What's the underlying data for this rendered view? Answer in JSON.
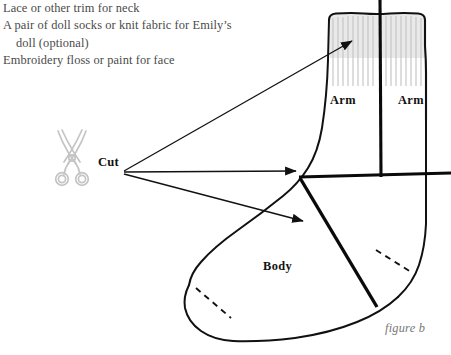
{
  "page": {
    "figure_caption": "figure b",
    "background_color": "#ffffff",
    "ink_color": "#111111",
    "caption_color": "#777777",
    "scissors_color": "#c9c9c9",
    "cuff_shading_color": "#d8d8d8"
  },
  "materials": {
    "lines": [
      {
        "text": "Lace or other trim for neck",
        "indent": false
      },
      {
        "text": "A pair of doll socks or knit fabric for Emily’s",
        "indent": false
      },
      {
        "text": "doll (optional)",
        "indent": true
      },
      {
        "text": "Embroidery floss or paint for face",
        "indent": false
      }
    ]
  },
  "cut_callout": {
    "label": "Cut",
    "icon": "scissors-icon",
    "arrow_count": 3,
    "origin": {
      "x": 123,
      "y": 172
    },
    "targets": [
      {
        "x": 350,
        "y": 42,
        "name": "cuff-ribbing"
      },
      {
        "x": 299,
        "y": 172,
        "name": "horizontal-cut-line"
      },
      {
        "x": 305,
        "y": 222,
        "name": "diagonal-cut-line"
      }
    ]
  },
  "diagram": {
    "name": "sock-cutting-diagram",
    "labels": [
      {
        "id": "arm-left",
        "text": "Arm",
        "x": 330,
        "y": 93
      },
      {
        "id": "arm-right",
        "text": "Arm",
        "x": 398,
        "y": 93
      },
      {
        "id": "body",
        "text": "Body",
        "x": 263,
        "y": 259
      }
    ],
    "cut_lines": [
      {
        "id": "vertical-cuff-cut",
        "from": {
          "x": 379,
          "y": 0
        },
        "to": {
          "x": 381,
          "y": 176
        }
      },
      {
        "id": "horizontal-ankle-cut",
        "from": {
          "x": 300,
          "y": 177
        },
        "to": {
          "x": 451,
          "y": 173
        }
      },
      {
        "id": "diagonal-body-cut",
        "from": {
          "x": 300,
          "y": 178
        },
        "to": {
          "x": 376,
          "y": 306
        }
      }
    ],
    "stitch_guides": [
      {
        "id": "toe-dashed-guide",
        "from": {
          "x": 196,
          "y": 288
        },
        "to": {
          "x": 230,
          "y": 317
        }
      },
      {
        "id": "heel-dashed-guide",
        "from": {
          "x": 376,
          "y": 250
        },
        "to": {
          "x": 410,
          "y": 271
        }
      }
    ]
  }
}
